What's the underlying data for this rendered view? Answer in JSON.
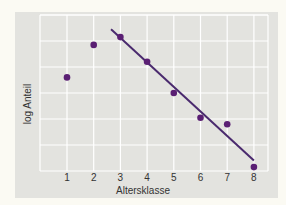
{
  "chart_data": {
    "type": "scatter",
    "title": "",
    "xlabel": "Altersklasse",
    "ylabel": "log Anteil",
    "x_ticks": [
      "1",
      "2",
      "3",
      "4",
      "5",
      "6",
      "7",
      "8"
    ],
    "xlim": [
      0,
      8.5
    ],
    "ylim": [
      0,
      6
    ],
    "grid": true,
    "legend": null,
    "series": [
      {
        "name": "Beobachtungen",
        "type": "scatter",
        "x": [
          1,
          2,
          3,
          4,
          5,
          6,
          7,
          8
        ],
        "y": [
          3.6,
          4.85,
          5.15,
          4.2,
          3.0,
          2.05,
          1.8,
          0.15
        ]
      },
      {
        "name": "Regressionsgerade",
        "type": "line",
        "x": [
          2.65,
          8
        ],
        "y": [
          5.45,
          0.4
        ]
      }
    ],
    "colors": {
      "points": "#5a1f73",
      "line": "#4a2a6e",
      "panel": "#e3e3df",
      "grid": "#ffffff",
      "background": "#fbfaf3"
    }
  }
}
